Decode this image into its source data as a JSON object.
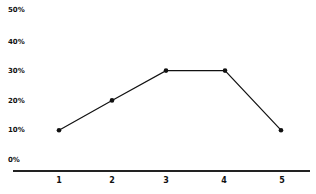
{
  "chart_data": {
    "type": "line",
    "title": "",
    "xlabel": "",
    "ylabel": "",
    "categories": [
      "1",
      "2",
      "3",
      "4",
      "5"
    ],
    "x": [
      1,
      2,
      3,
      4,
      5
    ],
    "series": [
      {
        "name": "",
        "values": [
          10,
          20,
          30,
          30,
          10
        ]
      }
    ],
    "y_tick_labels": [
      "0%",
      "10%",
      "20%",
      "30%",
      "40%",
      "50%"
    ],
    "x_tick_labels": [
      "1",
      "2",
      "3",
      "4",
      "5"
    ],
    "ylim": [
      0,
      50
    ],
    "grid": false,
    "legend": null,
    "markers": true,
    "colors": {
      "line": "#111111",
      "axis": "#222222",
      "text": "#111111"
    }
  }
}
